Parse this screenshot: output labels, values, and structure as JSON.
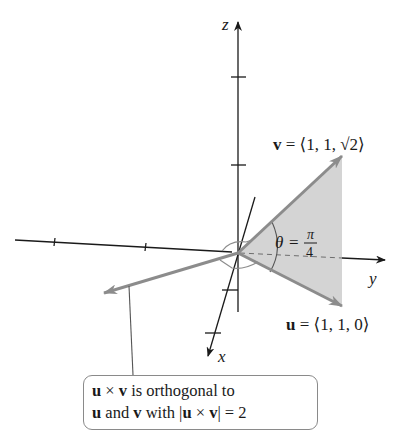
{
  "axes": {
    "x_label": "x",
    "y_label": "y",
    "z_label": "z"
  },
  "vectors": {
    "v": {
      "name": "v",
      "label_rest": " = ⟨1, 1, √2⟩",
      "components": [
        1,
        1,
        1.41421
      ]
    },
    "u": {
      "name": "u",
      "label_rest": " = ⟨1, 1, 0⟩",
      "components": [
        1,
        1,
        0
      ]
    },
    "uxv": {
      "name": "u × v"
    }
  },
  "angle": {
    "symbol": "θ",
    "equals": "=",
    "numerator": "π",
    "denominator": "4"
  },
  "callout": {
    "line1_a": "u",
    "line1_b": " × ",
    "line1_c": "v",
    "line1_d": " is orthogonal to",
    "line2_a": "u",
    "line2_b": " and ",
    "line2_c": "v",
    "line2_d": " with |",
    "line2_e": "u",
    "line2_f": " × ",
    "line2_g": "v",
    "line2_h": "| = 2"
  },
  "colors": {
    "axis": "#1a1a1a",
    "vector": "#8c8c8c",
    "shade": "#d4d4d4"
  }
}
